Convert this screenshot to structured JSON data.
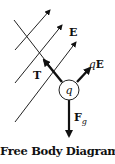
{
  "diagram": {
    "title": "Free Body Diagram",
    "charge_label": "q",
    "field_label": "E",
    "forces": [
      {
        "name": "tension",
        "label": "T",
        "direction": "up-left"
      },
      {
        "name": "electric-force",
        "label_italic": "q",
        "label_bold": "E",
        "direction": "up-right"
      },
      {
        "name": "gravity",
        "label": "F",
        "subscript": "g",
        "direction": "down"
      }
    ],
    "colors": {
      "ink": "#111111",
      "background": "#ffffff"
    }
  }
}
